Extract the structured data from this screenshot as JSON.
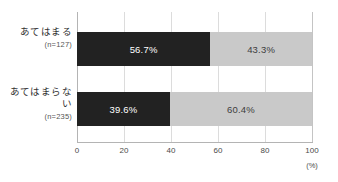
{
  "chart_data": {
    "type": "bar",
    "orientation": "horizontal",
    "stacked": true,
    "stacked_percent": true,
    "title": "",
    "subtitle": "",
    "xlabel": "(%)",
    "ylabel": "",
    "xlim": [
      0,
      100
    ],
    "grid": true,
    "legend": false,
    "legend_position": "none",
    "categories": [
      {
        "label": "あてはまる",
        "n_label": "(n=127)",
        "n": 127
      },
      {
        "label": "あてはまらない",
        "n_label": "(n=235)",
        "n": 235
      }
    ],
    "xticks": [
      {
        "value": 0,
        "label": "0"
      },
      {
        "value": 20,
        "label": "20"
      },
      {
        "value": 40,
        "label": "40"
      },
      {
        "value": 60,
        "label": "60"
      },
      {
        "value": 80,
        "label": "80"
      },
      {
        "value": 100,
        "label": "100"
      }
    ],
    "series": [
      {
        "name": "segment-1",
        "color": "#222222",
        "text_color": "#ffffff",
        "values": [
          56.7,
          39.6
        ],
        "data_labels": [
          "56.7%",
          "39.6%"
        ]
      },
      {
        "name": "segment-2",
        "color": "#c9c9c9",
        "text_color": "#3d3d3d",
        "values": [
          43.3,
          60.4
        ],
        "data_labels": [
          "43.3%",
          "60.4%"
        ]
      }
    ],
    "rows": [
      {
        "category": "あてはまる",
        "n_label": "(n=127)",
        "segments": [
          {
            "value": 56.7,
            "label": "56.7%"
          },
          {
            "value": 43.3,
            "label": "43.3%"
          }
        ]
      },
      {
        "category": "あてはまらない",
        "n_label": "(n=235)",
        "segments": [
          {
            "value": 39.6,
            "label": "39.6%"
          },
          {
            "value": 60.4,
            "label": "60.4%"
          }
        ]
      }
    ],
    "colors": {
      "segment_dark": "#222222",
      "segment_light": "#c9c9c9",
      "gridline": "#dcdcdc",
      "axis": "#b4b4b4",
      "background": "#ffffff",
      "text": "#3a3a3a"
    }
  }
}
